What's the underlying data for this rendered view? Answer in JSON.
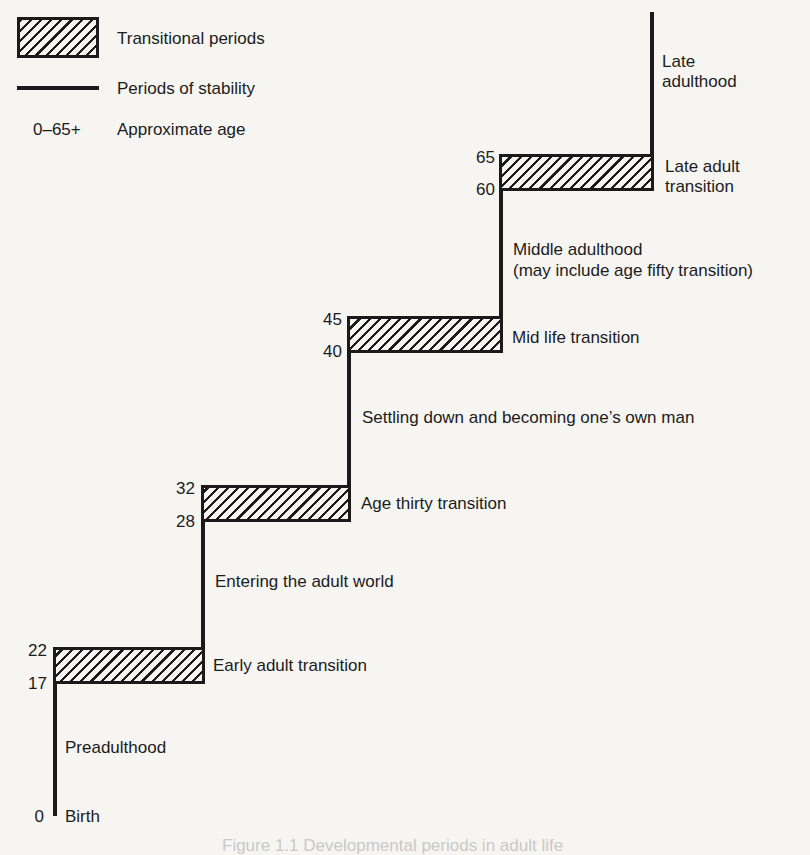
{
  "legend": {
    "transitional_label": "Transitional periods",
    "stability_label": "Periods of stability",
    "age_range": "0–65+",
    "age_label": "Approximate age"
  },
  "diagram": {
    "birth": {
      "age": "0",
      "label": "Birth"
    },
    "stable_periods": [
      {
        "name": "Preadulthood",
        "start_age": 0,
        "end_age": 17
      },
      {
        "name": "Entering the adult world",
        "start_age": 22,
        "end_age": 28
      },
      {
        "name": "Settling down and becoming one’s own man",
        "start_age": 32,
        "end_age": 40
      },
      {
        "name": "Middle adulthood",
        "note": "(may include age fifty transition)",
        "start_age": 45,
        "end_age": 60
      },
      {
        "name_line1": "Late",
        "name_line2": "adulthood",
        "start_age": 65,
        "end_age": null
      }
    ],
    "transitions": [
      {
        "name": "Early adult transition",
        "start_age": "17",
        "end_age": "22"
      },
      {
        "name": "Age thirty transition",
        "start_age": "28",
        "end_age": "32"
      },
      {
        "name": "Mid life transition",
        "start_age": "40",
        "end_age": "45"
      },
      {
        "name_line1": "Late adult",
        "name_line2": "transition",
        "start_age": "60",
        "end_age": "65"
      }
    ]
  },
  "caption": "Figure 1.1 Developmental periods in adult life",
  "colors": {
    "ink": "#1a1a1a",
    "paper": "#f6f5f2"
  }
}
